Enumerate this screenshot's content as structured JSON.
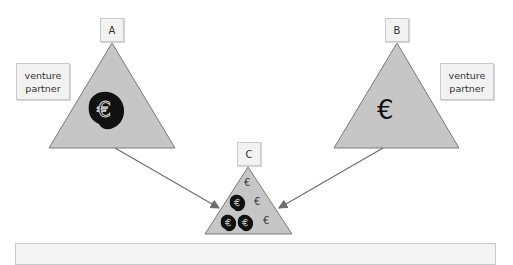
{
  "diagram": {
    "nodes": [
      {
        "id": "A",
        "label": "A",
        "side_label": "venture partner",
        "content": "single large euro coin icon (dark blob)"
      },
      {
        "id": "B",
        "label": "B",
        "side_label": "venture partner",
        "content": "single euro sign"
      },
      {
        "id": "C",
        "label": "C",
        "content": "three euro coin icons and three euro signs"
      }
    ],
    "edges": [
      {
        "from": "A",
        "to": "C"
      },
      {
        "from": "B",
        "to": "C"
      }
    ],
    "euro_symbol": "€",
    "colors": {
      "triangle_fill": "#c6c6c6",
      "triangle_stroke": "#7a7a7a",
      "arrow": "#6e6e6e",
      "label_box": "#f2f2f2",
      "coin_fill": "#111111"
    }
  }
}
